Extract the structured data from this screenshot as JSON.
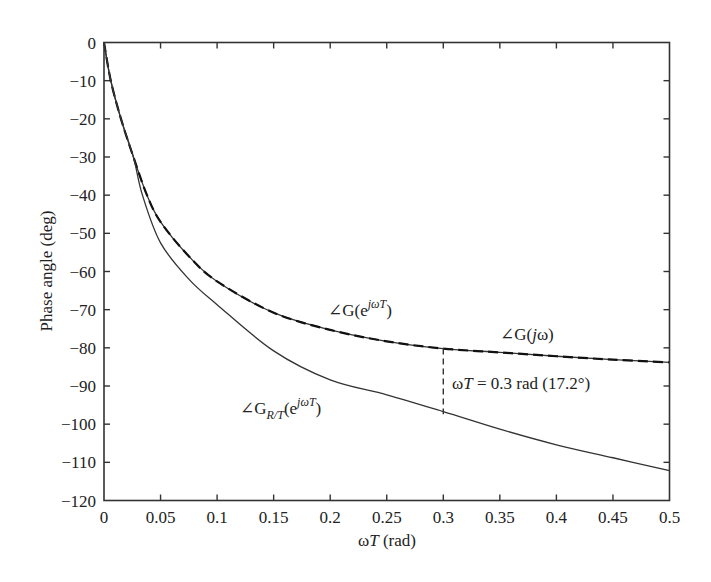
{
  "chart_data": {
    "type": "line",
    "title": "",
    "xlabel": "ωT (rad)",
    "ylabel": "Phase angle (deg)",
    "xlim": [
      0,
      0.5
    ],
    "ylim": [
      -120,
      0
    ],
    "grid": false,
    "xticks": [
      0,
      0.05,
      0.1,
      0.15,
      0.2,
      0.25,
      0.3,
      0.35,
      0.4,
      0.45,
      0.5
    ],
    "xtick_labels": [
      "0",
      "0.05",
      "0.1",
      "0.15",
      "0.2",
      "0.25",
      "0.3",
      "0.35",
      "0.4",
      "0.45",
      "0.5"
    ],
    "yticks": [
      0,
      -10,
      -20,
      -30,
      -40,
      -50,
      -60,
      -70,
      -80,
      -90,
      -100,
      -110,
      -120
    ],
    "ytick_labels": [
      "0",
      "−10",
      "−20",
      "−30",
      "−40",
      "−50",
      "−60",
      "−70",
      "−80",
      "−90",
      "−100",
      "−110",
      "−120"
    ],
    "series": [
      {
        "name": "∠G(jω)",
        "style": "solid",
        "x": [
          0,
          0.006,
          0.015,
          0.026,
          0.038,
          0.05,
          0.075,
          0.1,
          0.15,
          0.2,
          0.25,
          0.3,
          0.35,
          0.4,
          0.45,
          0.5
        ],
        "y": [
          0,
          -10,
          -20,
          -30,
          -40,
          -47,
          -56,
          -62.6,
          -70.8,
          -75.3,
          -78.3,
          -80.2,
          -81.2,
          -82.2,
          -83.1,
          -83.8
        ]
      },
      {
        "name": "∠G(e^{jωT})",
        "style": "dashed",
        "x": [
          0,
          0.006,
          0.015,
          0.026,
          0.038,
          0.05,
          0.075,
          0.1,
          0.15,
          0.2,
          0.25,
          0.3,
          0.35,
          0.4,
          0.45,
          0.5
        ],
        "y": [
          0,
          -10,
          -20,
          -30,
          -40,
          -47,
          -56,
          -62.6,
          -70.8,
          -75.3,
          -78.3,
          -80.2,
          -81.2,
          -82.2,
          -83.1,
          -83.8
        ]
      },
      {
        "name": "∠G_{R/T}(e^{jωT})",
        "style": "solid",
        "x": [
          0,
          0.006,
          0.015,
          0.026,
          0.034,
          0.05,
          0.075,
          0.1,
          0.15,
          0.2,
          0.25,
          0.3,
          0.35,
          0.4,
          0.45,
          0.5
        ],
        "y": [
          0,
          -10,
          -20,
          -30,
          -40,
          -52.5,
          -62,
          -68.7,
          -80.8,
          -88.4,
          -92.3,
          -96.7,
          -101.3,
          -105.4,
          -108.8,
          -112.2
        ]
      }
    ],
    "annotations": [
      {
        "text": "∠G(e^{jωT})",
        "x": 0.2,
        "y": -70
      },
      {
        "text": "∠G(jω)",
        "x": 0.355,
        "y": -77
      },
      {
        "text": "∠G_{R/T}(e^{jωT})",
        "x": 0.11,
        "y": -97
      },
      {
        "text": "ωT = 0.3 rad (17.2°)",
        "x": 0.31,
        "y": -89
      },
      {
        "type": "vline-dashed",
        "x": 0.3,
        "y_from": -80.2,
        "y_to": -97.4
      }
    ]
  },
  "labels": {
    "xlabel_omega": "ω",
    "xlabel_T": "T",
    "xlabel_rest": " (rad)",
    "ylabel": "Phase angle (deg)",
    "ann_gz_angle": "∠G(e",
    "ann_gz_sup": "jωT",
    "ann_gz_close": ")",
    "ann_gjw_prefix": "∠G(",
    "ann_gjw_j": "j",
    "ann_gjw_rest": "ω)",
    "ann_grt_prefix": "∠G",
    "ann_grt_sub": "R/T",
    "ann_grt_mid": "(e",
    "ann_grt_sup": "jωT",
    "ann_grt_close": ")",
    "ann_wt_omega": "ω",
    "ann_wt_T": "T",
    "ann_wt_rest": " = 0.3 rad (17.2°)"
  }
}
